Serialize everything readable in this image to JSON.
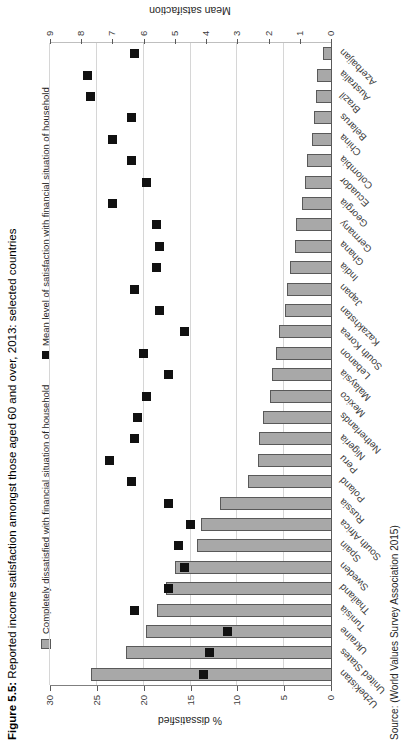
{
  "figure": {
    "title_prefix": "Figure 5.5:",
    "title_rest": " Reported income satisfaction amongst those aged 60 and over, 2013: selected countries",
    "source": "Source: (World Values Survey Association 2015)",
    "orientation": "landscape chart rotated 90 degrees counter-clockwise on the page"
  },
  "legend": {
    "bars_label": "Completely dissatisfied with financial situation of household",
    "mean_label": "Mean level of satisfaction with financial situation of household"
  },
  "colors": {
    "bar_fill": "#a8a8a8",
    "bar_border": "#595959",
    "mean_marker": "#111111",
    "gridline": "#d6d6d6",
    "axis_line": "#595959",
    "text": "#262626"
  },
  "chart_data": {
    "type": "bar",
    "subtype": "dual-axis column chart with square scatter markers (secondary axis)",
    "categories_top_to_bottom_on_page": [
      "Azerbaijan",
      "Australia",
      "Brazil",
      "Belarus",
      "China",
      "Colombia",
      "Ecuador",
      "Georgia",
      "Germany",
      "Ghana",
      "India",
      "Japan",
      "Kazakhstan",
      "South Korea",
      "Lebanon",
      "Malaysia",
      "Mexico",
      "Netherlands",
      "Nigeria",
      "Peru",
      "Poland",
      "Russia",
      "South Africa",
      "Spain",
      "Sweden",
      "Thailand",
      "Tunisia",
      "Ukraine",
      "United States",
      "Uzbekistan"
    ],
    "series": [
      {
        "name": "Completely dissatisfied with financial situation of household",
        "type": "bar",
        "axis": "primary",
        "values": [
          0.9,
          1.5,
          1.6,
          1.8,
          2.0,
          2.6,
          2.8,
          3.1,
          3.7,
          3.8,
          4.4,
          4.7,
          4.9,
          5.5,
          5.9,
          6.3,
          6.5,
          7.3,
          7.7,
          7.8,
          8.9,
          11.8,
          13.9,
          14.3,
          16.7,
          17.6,
          18.6,
          19.8,
          21.9,
          25.6
        ]
      },
      {
        "name": "Mean level of satisfaction with financial situation of household",
        "type": "scatter-square",
        "axis": "secondary",
        "values": [
          6.3,
          7.8,
          7.7,
          6.4,
          7.0,
          6.4,
          5.9,
          7.0,
          5.6,
          5.5,
          5.6,
          6.3,
          5.5,
          4.7,
          6.0,
          5.2,
          5.9,
          6.2,
          6.3,
          7.1,
          6.4,
          5.2,
          4.5,
          4.9,
          4.7,
          5.2,
          6.3,
          3.3,
          3.9,
          4.1
        ]
      }
    ],
    "primary_axis": {
      "label": "% dissatisfied",
      "min": 0,
      "max": 30,
      "tick_step": 5,
      "ticks": [
        "0",
        "5",
        "10",
        "15",
        "20",
        "25",
        "30"
      ],
      "gridlines": true
    },
    "secondary_axis": {
      "label": "Mean satsifaction",
      "min": 0,
      "max": 9,
      "tick_step": 1,
      "ticks": [
        "0",
        "1",
        "2",
        "3",
        "4",
        "5",
        "6",
        "7",
        "8",
        "9"
      ]
    },
    "legend_position": "top"
  }
}
